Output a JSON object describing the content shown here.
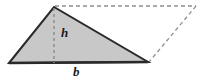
{
  "figure": {
    "name": "triangle-area-diagram",
    "background_color": "#ffffff",
    "canvas": {
      "width": 206,
      "height": 79
    },
    "triangle": {
      "name": "shaded-triangle",
      "fill_color": "#c8c8c8",
      "stroke_color": "#2a2a2a",
      "stroke_width": 2,
      "points": "9,63 54,7 148,62",
      "vertices": [
        {
          "name": "bottom-left-vertex",
          "x": 9,
          "y": 63
        },
        {
          "name": "apex-vertex",
          "x": 54,
          "y": 7
        },
        {
          "name": "bottom-right-vertex",
          "x": 148,
          "y": 62
        }
      ]
    },
    "base_line": {
      "name": "base-edge",
      "x1": 9,
      "y1": 63,
      "x2": 148,
      "y2": 62,
      "stroke_color": "#2a2a2a",
      "stroke_width": 2.6
    },
    "height_line": {
      "name": "height-segment",
      "x1": 54,
      "y1": 8,
      "x2": 54,
      "y2": 63,
      "stroke_color": "#8a8a8a",
      "stroke_width": 1.4,
      "dash": "3 3"
    },
    "parallelogram_top_line": {
      "name": "parallelogram-top-edge",
      "x1": 55,
      "y1": 6,
      "x2": 196,
      "y2": 6,
      "stroke_color": "#8f8f8f",
      "stroke_width": 1.3,
      "dash": "4 3"
    },
    "parallelogram_right_line": {
      "name": "parallelogram-right-edge",
      "x1": 196,
      "y1": 6,
      "x2": 149,
      "y2": 62,
      "stroke_color": "#8f8f8f",
      "stroke_width": 1.3,
      "dash": "4 3"
    },
    "labels": {
      "height": {
        "text": "h",
        "x": 61,
        "y": 37,
        "font_size": 13
      },
      "base": {
        "text": "b",
        "x": 73,
        "y": 76,
        "font_size": 13
      }
    }
  }
}
